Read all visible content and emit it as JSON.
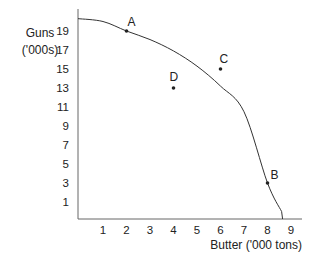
{
  "chart_data": {
    "type": "line",
    "title": "",
    "xlabel": "Butter ('000 tons)",
    "ylabel_lines": [
      "Guns",
      "('000s)"
    ],
    "x_ticks": [
      1,
      2,
      3,
      4,
      5,
      6,
      7,
      8,
      9
    ],
    "y_ticks": [
      1,
      3,
      5,
      7,
      9,
      11,
      13,
      15,
      17,
      19
    ],
    "xlim": [
      0,
      9.5
    ],
    "ylim": [
      0,
      21
    ],
    "grid": false,
    "legend": null,
    "series": [
      {
        "name": "Production possibility frontier",
        "style": "curve",
        "x": [
          0,
          1,
          2,
          3,
          4,
          5,
          6,
          7,
          8,
          8.6
        ],
        "y": [
          20.3,
          20.0,
          19.0,
          18.1,
          16.9,
          15.3,
          13.2,
          10.5,
          3.0,
          0
        ]
      }
    ],
    "points": [
      {
        "label": "A",
        "x": 2,
        "y": 19
      },
      {
        "label": "B",
        "x": 8,
        "y": 3
      },
      {
        "label": "C",
        "x": 6,
        "y": 15
      },
      {
        "label": "D",
        "x": 4,
        "y": 13
      }
    ]
  }
}
